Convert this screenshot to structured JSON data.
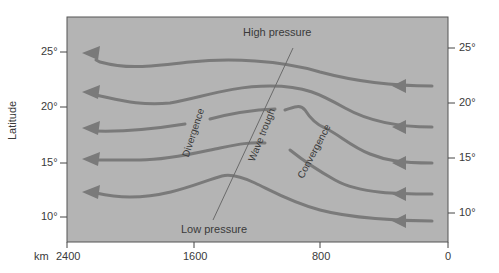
{
  "figure": {
    "type": "streamline-diagram",
    "colors": {
      "background": "#ffffff",
      "panel": "#b4b4b4",
      "streamline": "#7a7a7a",
      "trough_line": "#6a6a6a",
      "text": "#3a3a3a"
    },
    "y_axis": {
      "label": "Latitude",
      "left_ticks": [
        "25°",
        "20°",
        "15°",
        "10°"
      ],
      "right_ticks": [
        "25°",
        "20°",
        "15°",
        "10°"
      ]
    },
    "x_axis": {
      "unit": "km",
      "ticks": [
        "2400",
        "1600",
        "800",
        "0"
      ]
    },
    "annotations": {
      "high_pressure": "High pressure",
      "low_pressure": "Low pressure",
      "divergence": "Divergence",
      "wave_trough": "Wave trough",
      "convergence": "Convergence"
    },
    "streamlines_count": 5,
    "flow_direction": "east-to-west"
  }
}
